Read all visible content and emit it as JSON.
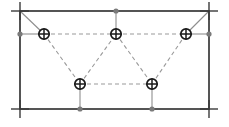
{
  "figure": {
    "width": 229,
    "height": 127,
    "background": "#ffffff"
  },
  "chart_data": {
    "type": "scatter",
    "title": "",
    "xlabel": "",
    "ylabel": "",
    "xlim": [
      0,
      229
    ],
    "ylim": [
      0,
      127
    ],
    "grid": false,
    "legend": "none",
    "series": [
      {
        "name": "nodes",
        "marker": "circled-cross",
        "points": [
          {
            "id": "n1",
            "x": 44,
            "y": 34,
            "label": "top-left node"
          },
          {
            "id": "n2",
            "x": 116,
            "y": 34,
            "label": "top-center node"
          },
          {
            "id": "n3",
            "x": 186,
            "y": 34,
            "label": "top-right node"
          },
          {
            "id": "n4",
            "x": 80,
            "y": 84,
            "label": "bottom-left node"
          },
          {
            "id": "n5",
            "x": 152,
            "y": 84,
            "label": "bottom-right node"
          }
        ]
      },
      {
        "name": "edge-dots",
        "marker": "dot",
        "points": [
          {
            "id": "d1",
            "x": 20,
            "y": 34,
            "label": "left edge support"
          },
          {
            "id": "d2",
            "x": 116,
            "y": 11,
            "label": "top edge support"
          },
          {
            "id": "d3",
            "x": 209,
            "y": 34,
            "label": "right edge support"
          },
          {
            "id": "d4",
            "x": 80,
            "y": 109,
            "label": "bottom-left support"
          },
          {
            "id": "d5",
            "x": 152,
            "y": 109,
            "label": "bottom-right support"
          }
        ]
      },
      {
        "name": "corner-crosses",
        "marker": "cross",
        "points": [
          {
            "id": "c1",
            "x": 20,
            "y": 11,
            "label": "top-left corner"
          },
          {
            "id": "c2",
            "x": 209,
            "y": 11,
            "label": "top-right corner"
          },
          {
            "id": "c3",
            "x": 20,
            "y": 109,
            "label": "bottom-left corner"
          },
          {
            "id": "c4",
            "x": 209,
            "y": 109,
            "label": "bottom-right corner"
          }
        ]
      }
    ],
    "frame": {
      "left": 20,
      "top": 11,
      "right": 209,
      "bottom": 109,
      "stroke": "#2b2b2b",
      "stroke_width": 1.6
    },
    "dashed_edges": [
      {
        "from": "n1",
        "to": "n2"
      },
      {
        "from": "n2",
        "to": "n3"
      },
      {
        "from": "n4",
        "to": "n5"
      },
      {
        "from": "n1",
        "to": "n4"
      },
      {
        "from": "n4",
        "to": "n2"
      },
      {
        "from": "n2",
        "to": "n5"
      },
      {
        "from": "n5",
        "to": "n3"
      }
    ],
    "solid_connectors": [
      {
        "from": "c1",
        "to": "n1"
      },
      {
        "from": "c2",
        "to": "n3"
      },
      {
        "from": "d1",
        "to": "n1"
      },
      {
        "from": "d3",
        "to": "n3"
      },
      {
        "from": "d2",
        "to": "n2"
      },
      {
        "from": "d4",
        "to": "n4"
      },
      {
        "from": "d5",
        "to": "n5"
      }
    ],
    "colors": {
      "frame": "#2b2b2b",
      "dashed": "#9a9a9a",
      "connector": "#8e8e8e",
      "node_stroke": "#1a1a1a",
      "node_fill": "#ffffff",
      "dot": "#7a7a7a",
      "cross": "#3a3a3a"
    }
  }
}
